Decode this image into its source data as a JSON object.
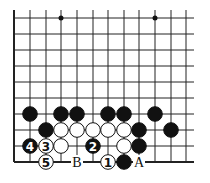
{
  "board": {
    "columns_x": [
      14,
      30,
      46,
      61,
      77,
      93,
      108,
      124,
      139,
      155,
      171,
      186
    ],
    "rows_y": [
      18,
      34,
      50,
      66,
      82,
      98,
      114,
      130,
      146,
      162
    ],
    "right_edge_x": 194,
    "top_edge_y": 10,
    "star_points": [
      [
        3,
        0
      ],
      [
        9,
        0
      ]
    ],
    "line_color": "#222222",
    "stones": [
      {
        "color": "black",
        "col": 1,
        "row": 6,
        "label": ""
      },
      {
        "color": "black",
        "col": 3,
        "row": 6,
        "label": ""
      },
      {
        "color": "black",
        "col": 4,
        "row": 6,
        "label": ""
      },
      {
        "color": "black",
        "col": 6,
        "row": 6,
        "label": ""
      },
      {
        "color": "black",
        "col": 7,
        "row": 6,
        "label": ""
      },
      {
        "color": "black",
        "col": 9,
        "row": 6,
        "label": ""
      },
      {
        "color": "black",
        "col": 2,
        "row": 7,
        "label": ""
      },
      {
        "color": "white",
        "col": 3,
        "row": 7,
        "label": ""
      },
      {
        "color": "white",
        "col": 4,
        "row": 7,
        "label": ""
      },
      {
        "color": "white",
        "col": 5,
        "row": 7,
        "label": ""
      },
      {
        "color": "white",
        "col": 6,
        "row": 7,
        "label": ""
      },
      {
        "color": "white",
        "col": 7,
        "row": 7,
        "label": ""
      },
      {
        "color": "black",
        "col": 8,
        "row": 7,
        "label": ""
      },
      {
        "color": "black",
        "col": 10,
        "row": 7,
        "label": ""
      },
      {
        "color": "black",
        "col": 1,
        "row": 8,
        "label": "4"
      },
      {
        "color": "white",
        "col": 2,
        "row": 8,
        "label": "3"
      },
      {
        "color": "white",
        "col": 3,
        "row": 8,
        "label": ""
      },
      {
        "color": "black",
        "col": 5,
        "row": 8,
        "label": "2"
      },
      {
        "color": "white",
        "col": 7,
        "row": 8,
        "label": ""
      },
      {
        "color": "black",
        "col": 8,
        "row": 8,
        "label": ""
      },
      {
        "color": "white",
        "col": 2,
        "row": 9,
        "label": "5"
      },
      {
        "color": "white",
        "col": 6,
        "row": 9,
        "label": "1"
      },
      {
        "color": "black",
        "col": 7,
        "row": 9,
        "label": ""
      }
    ],
    "markers": [
      {
        "col": 4,
        "row": 9,
        "label": "B"
      },
      {
        "col": 8,
        "row": 9,
        "label": "A"
      }
    ]
  }
}
